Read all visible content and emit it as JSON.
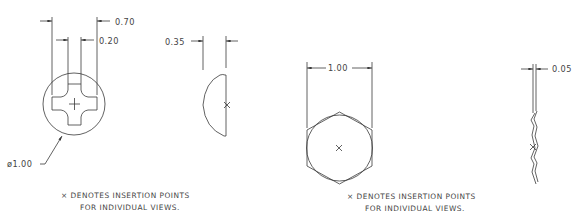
{
  "drawing": {
    "line_color": "#3a3a3a",
    "text_color": "#444444",
    "background": "#ffffff",
    "views": [
      {
        "name": "screw-head-top-view",
        "dimensions": {
          "outer_width": "0.70",
          "slot_width": "0.20",
          "diameter": "ø1.00"
        }
      },
      {
        "name": "screw-head-side-view",
        "dimensions": {
          "height": "0.35"
        }
      },
      {
        "name": "hex-head-top-view",
        "dimensions": {
          "across_flats": "1.00"
        }
      },
      {
        "name": "lock-washer-side-view",
        "dimensions": {
          "thickness": "0.05"
        }
      }
    ],
    "notes": [
      {
        "line1": "× DENOTES INSERTION POINTS",
        "line2": "FOR INDIVIDUAL VIEWS."
      },
      {
        "line1": "× DENOTES INSERTION POINTS",
        "line2": "FOR INDIVIDUAL VIEWS."
      }
    ]
  }
}
